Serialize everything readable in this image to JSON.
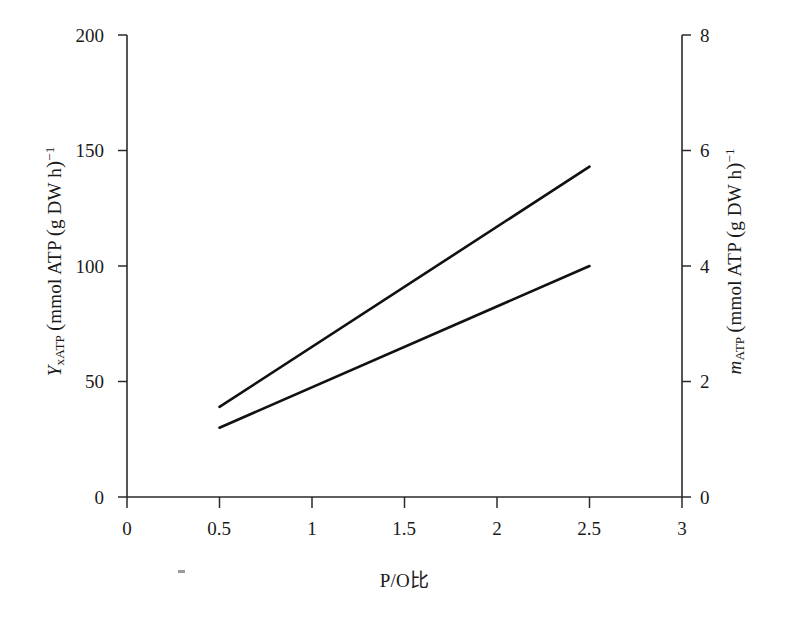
{
  "chart_data": {
    "type": "line",
    "title": "",
    "xlabel": "P/O比",
    "ylabel": "Y_xATP (mmol ATP (g DW h)^-1)",
    "ylabel_right": "m_ATP (mmol ATP (g DW h)^-1)",
    "xlim": [
      0,
      3
    ],
    "ylim": [
      0,
      200
    ],
    "ylim_right": [
      0,
      8
    ],
    "grid": false,
    "legend": "none",
    "xticks": [
      "0",
      "0.5",
      "1",
      "1.5",
      "2",
      "2.5",
      "3"
    ],
    "xtick_values": [
      0,
      0.5,
      1,
      1.5,
      2,
      2.5,
      3
    ],
    "yticks_left": [
      "0",
      "50",
      "100",
      "150",
      "200"
    ],
    "ytick_values_left": [
      0,
      50,
      100,
      150,
      200
    ],
    "yticks_right": [
      "0",
      "2",
      "4",
      "6",
      "8"
    ],
    "ytick_values_right": [
      0,
      2,
      4,
      6,
      8
    ],
    "series": [
      {
        "name": "Y_xATP",
        "axis": "left",
        "x": [
          0.5,
          2.5
        ],
        "values": [
          39,
          143
        ]
      },
      {
        "name": "m_ATP",
        "axis": "right",
        "x": [
          0.5,
          2.5
        ],
        "values": [
          1.2,
          4.0
        ],
        "values_left_scale": [
          29,
          100
        ]
      }
    ]
  },
  "axes": {
    "left_title": {
      "symbol": "Y",
      "symbol_sub": "xATP",
      "unit_open": "(",
      "unit_text": "mmol ATP",
      "unit_inner_open": "(",
      "unit_inner": "g DW h",
      "unit_inner_close": ")",
      "unit_exp": "−1",
      "unit_close": ""
    },
    "right_title": {
      "symbol": "m",
      "symbol_sub": "ATP",
      "unit_open": "(",
      "unit_text": "mmol ATP",
      "unit_inner_open": "(",
      "unit_inner": "g DW h",
      "unit_inner_close": ")",
      "unit_exp": "−1",
      "unit_close": ""
    },
    "x_title": "P/O比"
  }
}
